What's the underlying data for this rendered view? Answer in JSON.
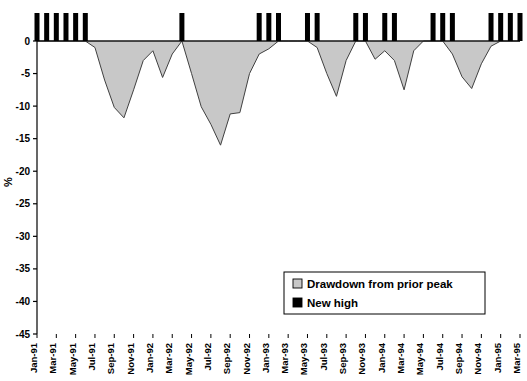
{
  "chart_data": {
    "type": "area",
    "title": "",
    "xlabel": "",
    "ylabel": "%",
    "ylim": [
      -45,
      3
    ],
    "yticks": [
      0,
      -5,
      -10,
      -15,
      -20,
      -25,
      -30,
      -35,
      -40,
      -45
    ],
    "ytick_labels": [
      "0",
      "-5",
      "-10",
      "-15",
      "-20",
      "-25",
      "-30",
      "-35",
      "-40",
      "-45"
    ],
    "grid": false,
    "legend_position": "inside-lower-right",
    "legend": [
      {
        "label": "Drawdown from prior peak",
        "color": "#c8c8c8",
        "marker": "filled-square-light"
      },
      {
        "label": "New high",
        "color": "#000000",
        "marker": "filled-square-dark"
      }
    ],
    "x": [
      "Jan-91",
      "Feb-91",
      "Mar-91",
      "Apr-91",
      "May-91",
      "Jun-91",
      "Jul-91",
      "Aug-91",
      "Sep-91",
      "Oct-91",
      "Nov-91",
      "Dec-91",
      "Jan-92",
      "Feb-92",
      "Mar-92",
      "Apr-92",
      "May-92",
      "Jun-92",
      "Jul-92",
      "Aug-92",
      "Sep-92",
      "Oct-92",
      "Nov-92",
      "Dec-92",
      "Jan-93",
      "Feb-93",
      "Mar-93",
      "Apr-93",
      "May-93",
      "Jun-93",
      "Jul-93",
      "Aug-93",
      "Sep-93",
      "Oct-93",
      "Nov-93",
      "Dec-93",
      "Jan-94",
      "Feb-94",
      "Mar-94",
      "Apr-94",
      "May-94",
      "Jun-94",
      "Jul-94",
      "Aug-94",
      "Sep-94",
      "Oct-94",
      "Nov-94",
      "Dec-94",
      "Jan-95",
      "Feb-95",
      "Mar-95"
    ],
    "xtick_labels": [
      "Jan-91",
      "Mar-91",
      "May-91",
      "Jul-91",
      "Sep-91",
      "Nov-91",
      "Jan-92",
      "Mar-92",
      "May-92",
      "Jul-92",
      "Sep-92",
      "Nov-92",
      "Jan-93",
      "Mar-93",
      "May-93",
      "Jul-93",
      "Sep-93",
      "Nov-93",
      "Jan-94",
      "Mar-94",
      "May-94",
      "Jul-94",
      "Sep-94",
      "Nov-94",
      "Jan-95",
      "Mar-95"
    ],
    "series": [
      {
        "name": "Drawdown from prior peak",
        "type": "area",
        "color": "#c8c8c8",
        "values": [
          0,
          0,
          0,
          0,
          0,
          0,
          -1.0,
          -6.0,
          -10.2,
          -11.8,
          -7.5,
          -3.0,
          -1.5,
          -5.6,
          -2.0,
          0,
          -5.0,
          -10.1,
          -12.8,
          -16.0,
          -11.2,
          -11.0,
          -5.0,
          -2.0,
          -1.2,
          0,
          0,
          0,
          0,
          -1.0,
          -5.0,
          -8.5,
          -3.0,
          0,
          0,
          -2.8,
          -1.5,
          -3.0,
          -7.5,
          -1.5,
          0,
          0,
          0,
          -2.0,
          -5.5,
          -7.3,
          -3.5,
          -0.8,
          0,
          0,
          0
        ]
      },
      {
        "name": "New high",
        "type": "bar",
        "color": "#000000",
        "bar_value": 3,
        "months": [
          "Jan-91",
          "Feb-91",
          "Mar-91",
          "Apr-91",
          "May-91",
          "Jun-91",
          "Apr-92",
          "Dec-92",
          "Jan-93",
          "Feb-93",
          "May-93",
          "Jun-93",
          "Oct-93",
          "Nov-93",
          "Jan-94",
          "Feb-94",
          "Jun-94",
          "Jul-94",
          "Aug-94",
          "Dec-94",
          "Jan-95",
          "Feb-95",
          "Mar-95"
        ]
      }
    ]
  },
  "axes": {
    "y_axis_title": "%"
  }
}
